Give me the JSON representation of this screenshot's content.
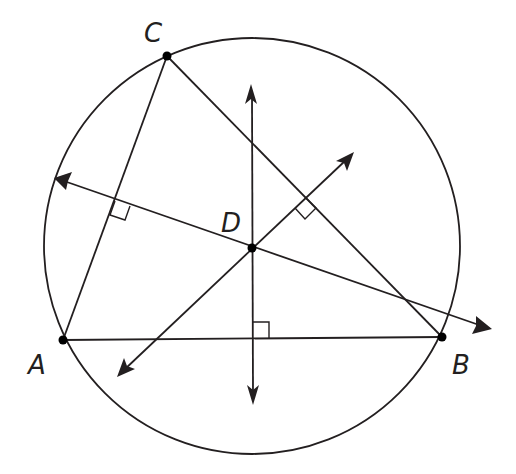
{
  "diagram": {
    "points": [
      {
        "name": "A",
        "label": "A",
        "x": 63,
        "y": 340
      },
      {
        "name": "B",
        "label": "B",
        "x": 442,
        "y": 337
      },
      {
        "name": "C",
        "label": "C",
        "x": 167,
        "y": 56
      },
      {
        "name": "D",
        "label": "D",
        "x": 252,
        "y": 248
      }
    ],
    "circle": {
      "cx": 252,
      "cy": 246,
      "r": 208
    },
    "segments": [
      "AB",
      "BC",
      "CA"
    ],
    "perpendicular_bisectors": [
      "of AB (vertical)",
      "of AC",
      "of BC"
    ],
    "right_angle_marks": 3,
    "colors": {
      "stroke": "#231f20",
      "background": "#ffffff"
    }
  }
}
